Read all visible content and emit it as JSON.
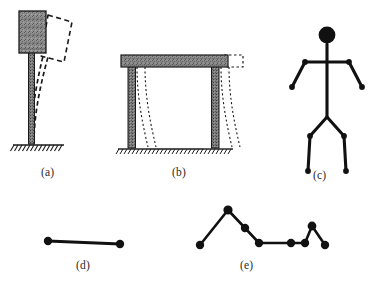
{
  "figure": {
    "background_color": "#ffffff",
    "ink_color": "#1a1a1a",
    "hatch_color": "#2b2b2b",
    "fill_gray": "#8c8c8c",
    "width": 371,
    "height": 291
  },
  "panels": [
    {
      "id": "a",
      "caption": "(a)",
      "name": "cantilever-column-with-top-mass",
      "description": "Vertical cantilever column fixed at a hatched ground line, carrying a shaded rectangular mass block at its top; a dashed outline shows the deflected (swayed) position of the mass.",
      "elements": {
        "mass_block": {
          "x": 19,
          "y": 11,
          "width": 27,
          "height": 42,
          "fill": "#8c8c8c",
          "stroke": "#1a1a1a"
        },
        "column": {
          "x": 28,
          "y": 53,
          "width": 6,
          "height": 90,
          "fill": "#8c8c8c",
          "stroke": "#1a1a1a"
        },
        "ground_line": {
          "x1": 13,
          "y1": 145,
          "x2": 64,
          "y2": 145
        },
        "dashed_displaced_mass": "dashed quadrilateral rotated clockwise to the right of the mass block",
        "dashed_deflected_column": "two dashed curved lines from base to displaced mass"
      }
    },
    {
      "id": "b",
      "caption": "(b)",
      "name": "single-storey-portal-frame",
      "description": "Single-bay single-storey portal frame: a shaded horizontal girder supported by two shaded vertical columns fixed at hatched ground lines; dotted curves show the swayed deformed shape and a dotted rectangle shows the displaced girder.",
      "elements": {
        "girder": {
          "x": 121,
          "y": 55,
          "width": 107,
          "height": 12,
          "fill": "#8c8c8c",
          "stroke": "#1a1a1a"
        },
        "left_column": {
          "x": 128,
          "y": 67,
          "width": 7,
          "height": 80,
          "fill": "#8c8c8c",
          "stroke": "#1a1a1a"
        },
        "right_column": {
          "x": 212,
          "y": 67,
          "width": 7,
          "height": 80,
          "fill": "#8c8c8c",
          "stroke": "#1a1a1a"
        },
        "left_ground_line": {
          "x1": 118,
          "y1": 149,
          "x2": 147,
          "y2": 149
        },
        "right_ground_line": {
          "x1": 203,
          "y1": 149,
          "x2": 232,
          "y2": 149
        },
        "dotted_displaced_girder": "dotted rectangle offset to the right of the girder",
        "dotted_deformed_columns": "pairs of dotted S-curves beside each column"
      }
    },
    {
      "id": "c",
      "caption": "(c)",
      "name": "multi-degree-of-freedom-stick-figure",
      "description": "Human-like stick figure: filled circular head, vertical spine, horizontal shoulder bar with two downward-angled arms ending in filled joint dots, and two downward-splayed legs ending in filled joint dots.",
      "elements": {
        "head": {
          "cx": 327,
          "cy": 36,
          "r": 8
        },
        "neck": {
          "x1": 327,
          "y1": 44,
          "x2": 327,
          "y2": 58
        },
        "shoulder_bar": {
          "x1": 305,
          "y1": 62,
          "x2": 349,
          "y2": 62
        },
        "spine": {
          "x1": 327,
          "y1": 58,
          "x2": 327,
          "y2": 117
        },
        "left_arm": {
          "from": [
            305,
            62
          ],
          "to": [
            292,
            87
          ]
        },
        "right_arm": {
          "from": [
            349,
            62
          ],
          "to": [
            362,
            87
          ]
        },
        "left_thigh": {
          "from": [
            327,
            117
          ],
          "to": [
            310,
            136
          ]
        },
        "right_thigh": {
          "from": [
            327,
            117
          ],
          "to": [
            344,
            136
          ]
        },
        "left_shin": {
          "from": [
            310,
            136
          ],
          "to": [
            308,
            172
          ]
        },
        "right_shin": {
          "from": [
            344,
            136
          ],
          "to": [
            346,
            172
          ]
        },
        "joint_dots": 8
      }
    },
    {
      "id": "d",
      "caption": "(d)",
      "name": "single-degree-of-freedom-line-element",
      "description": "A single straight horizontal line element with one filled node dot at each end.",
      "elements": {
        "line": {
          "x1": 48,
          "y1": 241,
          "x2": 120,
          "y2": 244
        },
        "nodes": [
          [
            48,
            241
          ],
          [
            120,
            244
          ]
        ],
        "node_count": 2
      }
    },
    {
      "id": "e",
      "caption": "(e)",
      "name": "multi-node-lumped-mass-chain",
      "description": "A polyline chain of connected line elements with filled node dots forming two peaks: a tall left peak and a shorter right peak, joined by a flat central segment.",
      "elements": {
        "node_count": 8,
        "nodes": [
          [
            200,
            245
          ],
          [
            228,
            210
          ],
          [
            245,
            228
          ],
          [
            259,
            243
          ],
          [
            291,
            243
          ],
          [
            305,
            243
          ],
          [
            312,
            226
          ],
          [
            325,
            245
          ]
        ],
        "polyline": "200,245 228,210 245,228 259,243 291,243 305,243 312,226 325,245"
      }
    }
  ],
  "captions": {
    "a": "(a)",
    "b": "(b)",
    "c": "(c)",
    "d": "(d)",
    "e": "(e)"
  }
}
